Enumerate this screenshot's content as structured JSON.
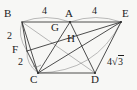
{
  "figure": {
    "kind": "plane-geometry-diagram",
    "background_color": "#f7f7f5",
    "stroke_color": "#3a3a3a",
    "light_stroke_color": "#9a9a9a",
    "text_color": "#1c1c1c",
    "vertices": [
      {
        "id": "B",
        "label": "B",
        "x": 22,
        "y": 22,
        "label_x": 4,
        "label_y": 8
      },
      {
        "id": "A",
        "label": "A",
        "x": 70,
        "y": 22,
        "label_x": 65,
        "label_y": 8
      },
      {
        "id": "E",
        "label": "E",
        "x": 121,
        "y": 22,
        "label_x": 122,
        "label_y": 8
      },
      {
        "id": "G",
        "label": "G",
        "x": 60,
        "y": 33,
        "label_x": 51,
        "label_y": 22
      },
      {
        "id": "H",
        "label": "H",
        "x": 73,
        "y": 43,
        "label_x": 67,
        "label_y": 33
      },
      {
        "id": "F",
        "label": "F",
        "x": 27,
        "y": 51,
        "label_x": 12,
        "label_y": 44
      },
      {
        "id": "C",
        "label": "C",
        "x": 38,
        "y": 73,
        "label_x": 30,
        "label_y": 74
      },
      {
        "id": "D",
        "label": "D",
        "x": 95,
        "y": 73,
        "label_x": 91,
        "label_y": 74
      }
    ],
    "segments": [
      {
        "from": "B",
        "to": "A",
        "weight": "normal"
      },
      {
        "from": "A",
        "to": "E",
        "weight": "normal"
      },
      {
        "from": "B",
        "to": "F",
        "weight": "normal"
      },
      {
        "from": "F",
        "to": "C",
        "weight": "normal"
      },
      {
        "from": "C",
        "to": "D",
        "weight": "normal"
      },
      {
        "from": "D",
        "to": "E",
        "weight": "normal"
      },
      {
        "from": "B",
        "to": "C",
        "weight": "normal"
      },
      {
        "from": "A",
        "to": "C",
        "weight": "normal"
      },
      {
        "from": "A",
        "to": "D",
        "weight": "normal"
      },
      {
        "from": "C",
        "to": "E",
        "weight": "normal"
      },
      {
        "from": "F",
        "to": "E",
        "weight": "normal"
      },
      {
        "from": "D",
        "to": "E",
        "weight": "normal"
      },
      {
        "from": "B",
        "to": "D",
        "weight": "light"
      }
    ],
    "arcs": [
      {
        "id": "arc-BA",
        "label": "4",
        "from": "B",
        "to": "A",
        "bulge": -7
      },
      {
        "id": "arc-AE",
        "label": "4",
        "from": "A",
        "to": "E",
        "bulge": -7
      },
      {
        "id": "arc-BF",
        "label": "2",
        "from": "B",
        "to": "F",
        "bulge": -6
      },
      {
        "id": "arc-FC",
        "label": "2",
        "from": "F",
        "to": "C",
        "bulge": -6
      },
      {
        "id": "arc-CE",
        "label": "4√3",
        "from": "C",
        "to": "E",
        "bulge": 10
      }
    ],
    "measure_labels": [
      {
        "id": "len-BA",
        "text": "4",
        "x": 42,
        "y": 6,
        "size": 10
      },
      {
        "id": "len-AE",
        "text": "4",
        "x": 92,
        "y": 6,
        "size": 10
      },
      {
        "id": "len-BF",
        "text": "2",
        "x": 7,
        "y": 31,
        "size": 10
      },
      {
        "id": "len-FC",
        "text": "2",
        "x": 18,
        "y": 57,
        "size": 10
      },
      {
        "id": "len-CE",
        "text": "4",
        "x": 108,
        "y": 58,
        "size": 10
      }
    ],
    "radical_label": {
      "id": "len-CE-radical",
      "coefficient": "4",
      "radicand": "3",
      "text": "4√3",
      "x": 108,
      "y": 58
    },
    "angle_mark": {
      "id": "angle-at-C",
      "x": 38,
      "y": 73,
      "radius": 7
    }
  }
}
